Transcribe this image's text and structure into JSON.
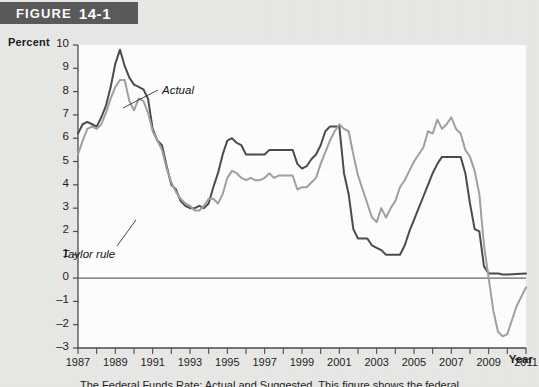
{
  "figure": {
    "banner_word": "FIGURE",
    "banner_number": "14-1"
  },
  "caption": {
    "text": "The Federal Funds Rate: Actual and Suggested. This figure shows the federal"
  },
  "axes": {
    "y_axis_title": "Percent",
    "x_axis_title": "Year",
    "y_ticks": [
      "10",
      "9",
      "8",
      "7",
      "6",
      "5",
      "4",
      "3",
      "2",
      "1",
      "0",
      "–1",
      "–2",
      "–3"
    ],
    "x_ticks": [
      "1987",
      "1989",
      "1991",
      "1993",
      "1995",
      "1997",
      "1999",
      "2001",
      "2003",
      "2005",
      "2007",
      "2009",
      "2011"
    ]
  },
  "annotations": [
    {
      "label": "Actual",
      "x": 162,
      "y": 60
    },
    {
      "label": "Taylor rule",
      "x": 62,
      "y": 224
    }
  ],
  "colors": {
    "actual_line": "#4a4a4a",
    "taylor_line": "#a0a0a0",
    "zero_line": "#666666",
    "axis": "#4a4a4a",
    "banner_bg": "#585858",
    "page_bg": "#e9e9e7",
    "plot_bg": "#ffffff"
  },
  "chart_data": {
    "type": "line",
    "title": "FIGURE 14-1",
    "xlabel": "Year",
    "ylabel": "Percent",
    "xlim": [
      1987,
      2011
    ],
    "ylim": [
      -3,
      10
    ],
    "grid": false,
    "legend": "inline-annotations",
    "zero_reference_line": 0,
    "series": [
      {
        "name": "Actual",
        "color": "#4a4a4a",
        "points": [
          [
            1987.0,
            6.2
          ],
          [
            1987.25,
            6.6
          ],
          [
            1987.5,
            6.7
          ],
          [
            1987.75,
            6.6
          ],
          [
            1988.0,
            6.5
          ],
          [
            1988.25,
            6.9
          ],
          [
            1988.5,
            7.4
          ],
          [
            1988.75,
            8.2
          ],
          [
            1989.0,
            9.2
          ],
          [
            1989.25,
            9.8
          ],
          [
            1989.5,
            9.1
          ],
          [
            1989.75,
            8.6
          ],
          [
            1990.0,
            8.3
          ],
          [
            1990.25,
            8.2
          ],
          [
            1990.5,
            8.1
          ],
          [
            1990.75,
            7.7
          ],
          [
            1991.0,
            6.4
          ],
          [
            1991.25,
            5.9
          ],
          [
            1991.5,
            5.7
          ],
          [
            1991.75,
            4.8
          ],
          [
            1992.0,
            4.0
          ],
          [
            1992.25,
            3.8
          ],
          [
            1992.5,
            3.3
          ],
          [
            1992.75,
            3.1
          ],
          [
            1993.0,
            3.0
          ],
          [
            1993.25,
            3.0
          ],
          [
            1993.5,
            3.1
          ],
          [
            1993.75,
            3.0
          ],
          [
            1994.0,
            3.2
          ],
          [
            1994.25,
            3.9
          ],
          [
            1994.5,
            4.5
          ],
          [
            1994.75,
            5.3
          ],
          [
            1995.0,
            5.9
          ],
          [
            1995.25,
            6.0
          ],
          [
            1995.5,
            5.8
          ],
          [
            1995.75,
            5.7
          ],
          [
            1996.0,
            5.3
          ],
          [
            1996.25,
            5.3
          ],
          [
            1996.5,
            5.3
          ],
          [
            1996.75,
            5.3
          ],
          [
            1997.0,
            5.3
          ],
          [
            1997.25,
            5.5
          ],
          [
            1997.5,
            5.5
          ],
          [
            1997.75,
            5.5
          ],
          [
            1998.0,
            5.5
          ],
          [
            1998.25,
            5.5
          ],
          [
            1998.5,
            5.5
          ],
          [
            1998.75,
            4.9
          ],
          [
            1999.0,
            4.7
          ],
          [
            1999.25,
            4.8
          ],
          [
            1999.5,
            5.1
          ],
          [
            1999.75,
            5.3
          ],
          [
            2000.0,
            5.7
          ],
          [
            2000.25,
            6.3
          ],
          [
            2000.5,
            6.5
          ],
          [
            2000.75,
            6.5
          ],
          [
            2001.0,
            6.5
          ],
          [
            2001.25,
            4.5
          ],
          [
            2001.5,
            3.6
          ],
          [
            2001.75,
            2.1
          ],
          [
            2002.0,
            1.7
          ],
          [
            2002.25,
            1.7
          ],
          [
            2002.5,
            1.7
          ],
          [
            2002.75,
            1.4
          ],
          [
            2003.0,
            1.3
          ],
          [
            2003.25,
            1.2
          ],
          [
            2003.5,
            1.0
          ],
          [
            2003.75,
            1.0
          ],
          [
            2004.0,
            1.0
          ],
          [
            2004.25,
            1.0
          ],
          [
            2004.5,
            1.4
          ],
          [
            2004.75,
            2.0
          ],
          [
            2005.0,
            2.5
          ],
          [
            2005.25,
            3.0
          ],
          [
            2005.5,
            3.5
          ],
          [
            2005.75,
            4.0
          ],
          [
            2006.0,
            4.5
          ],
          [
            2006.25,
            4.9
          ],
          [
            2006.5,
            5.2
          ],
          [
            2006.75,
            5.2
          ],
          [
            2007.0,
            5.2
          ],
          [
            2007.25,
            5.2
          ],
          [
            2007.5,
            5.2
          ],
          [
            2007.75,
            4.5
          ],
          [
            2008.0,
            3.2
          ],
          [
            2008.25,
            2.1
          ],
          [
            2008.5,
            2.0
          ],
          [
            2008.75,
            0.5
          ],
          [
            2009.0,
            0.2
          ],
          [
            2009.25,
            0.2
          ],
          [
            2009.5,
            0.2
          ],
          [
            2009.75,
            0.15
          ],
          [
            2010.0,
            0.15
          ],
          [
            2010.5,
            0.18
          ],
          [
            2011.0,
            0.2
          ]
        ]
      },
      {
        "name": "Taylor rule",
        "color": "#a0a0a0",
        "points": [
          [
            1987.0,
            5.3
          ],
          [
            1987.25,
            5.9
          ],
          [
            1987.5,
            6.4
          ],
          [
            1987.75,
            6.5
          ],
          [
            1988.0,
            6.4
          ],
          [
            1988.25,
            6.6
          ],
          [
            1988.5,
            7.1
          ],
          [
            1988.75,
            7.7
          ],
          [
            1989.0,
            8.2
          ],
          [
            1989.25,
            8.5
          ],
          [
            1989.5,
            8.5
          ],
          [
            1989.75,
            7.6
          ],
          [
            1990.0,
            7.2
          ],
          [
            1990.25,
            7.7
          ],
          [
            1990.5,
            7.6
          ],
          [
            1990.75,
            7.1
          ],
          [
            1991.0,
            6.3
          ],
          [
            1991.25,
            5.9
          ],
          [
            1991.5,
            5.5
          ],
          [
            1991.75,
            4.7
          ],
          [
            1992.0,
            4.1
          ],
          [
            1992.25,
            3.7
          ],
          [
            1992.5,
            3.4
          ],
          [
            1992.75,
            3.2
          ],
          [
            1993.0,
            3.1
          ],
          [
            1993.25,
            2.9
          ],
          [
            1993.5,
            2.9
          ],
          [
            1993.75,
            3.1
          ],
          [
            1994.0,
            3.4
          ],
          [
            1994.25,
            3.4
          ],
          [
            1994.5,
            3.2
          ],
          [
            1994.75,
            3.6
          ],
          [
            1995.0,
            4.3
          ],
          [
            1995.25,
            4.6
          ],
          [
            1995.5,
            4.5
          ],
          [
            1995.75,
            4.3
          ],
          [
            1996.0,
            4.2
          ],
          [
            1996.25,
            4.3
          ],
          [
            1996.5,
            4.2
          ],
          [
            1996.75,
            4.2
          ],
          [
            1997.0,
            4.3
          ],
          [
            1997.25,
            4.5
          ],
          [
            1997.5,
            4.3
          ],
          [
            1997.75,
            4.4
          ],
          [
            1998.0,
            4.4
          ],
          [
            1998.25,
            4.4
          ],
          [
            1998.5,
            4.4
          ],
          [
            1998.75,
            3.8
          ],
          [
            1999.0,
            3.9
          ],
          [
            1999.25,
            3.9
          ],
          [
            1999.5,
            4.1
          ],
          [
            1999.75,
            4.3
          ],
          [
            2000.0,
            4.9
          ],
          [
            2000.25,
            5.4
          ],
          [
            2000.5,
            5.9
          ],
          [
            2000.75,
            6.3
          ],
          [
            2001.0,
            6.6
          ],
          [
            2001.25,
            6.4
          ],
          [
            2001.5,
            6.3
          ],
          [
            2001.75,
            5.3
          ],
          [
            2002.0,
            4.4
          ],
          [
            2002.25,
            3.8
          ],
          [
            2002.5,
            3.2
          ],
          [
            2002.75,
            2.6
          ],
          [
            2003.0,
            2.4
          ],
          [
            2003.25,
            3.0
          ],
          [
            2003.5,
            2.6
          ],
          [
            2003.75,
            3.0
          ],
          [
            2004.0,
            3.3
          ],
          [
            2004.25,
            3.9
          ],
          [
            2004.5,
            4.2
          ],
          [
            2004.75,
            4.6
          ],
          [
            2005.0,
            5.0
          ],
          [
            2005.25,
            5.3
          ],
          [
            2005.5,
            5.6
          ],
          [
            2005.75,
            6.3
          ],
          [
            2006.0,
            6.2
          ],
          [
            2006.25,
            6.8
          ],
          [
            2006.5,
            6.4
          ],
          [
            2006.75,
            6.6
          ],
          [
            2007.0,
            6.9
          ],
          [
            2007.25,
            6.4
          ],
          [
            2007.5,
            6.2
          ],
          [
            2007.75,
            5.5
          ],
          [
            2008.0,
            5.2
          ],
          [
            2008.25,
            4.6
          ],
          [
            2008.5,
            3.6
          ],
          [
            2008.75,
            1.4
          ],
          [
            2009.0,
            0.0
          ],
          [
            2009.25,
            -1.4
          ],
          [
            2009.5,
            -2.3
          ],
          [
            2009.75,
            -2.5
          ],
          [
            2010.0,
            -2.4
          ],
          [
            2010.25,
            -1.8
          ],
          [
            2010.5,
            -1.2
          ],
          [
            2010.75,
            -0.8
          ],
          [
            2011.0,
            -0.4
          ]
        ]
      }
    ]
  }
}
